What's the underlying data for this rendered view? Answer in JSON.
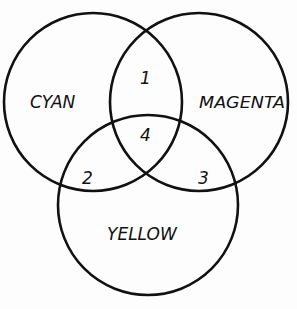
{
  "diagram": {
    "type": "venn",
    "stroke_color": "#111111",
    "background": "#fdfdfd",
    "sets": [
      {
        "name": "CYAN",
        "cx": 93,
        "cy": 102,
        "r": 89
      },
      {
        "name": "MAGENTA",
        "cx": 199,
        "cy": 102,
        "r": 89
      },
      {
        "name": "YELLOW",
        "cx": 148,
        "cy": 205,
        "r": 90
      }
    ],
    "regions": [
      {
        "label": "1",
        "between": [
          "CYAN",
          "MAGENTA"
        ]
      },
      {
        "label": "2",
        "between": [
          "CYAN",
          "YELLOW"
        ]
      },
      {
        "label": "3",
        "between": [
          "MAGENTA",
          "YELLOW"
        ]
      },
      {
        "label": "4",
        "between": [
          "CYAN",
          "MAGENTA",
          "YELLOW"
        ]
      }
    ]
  },
  "labels": {
    "cyan": "CYAN",
    "magenta": "MAGENTA",
    "yellow": "YELLOW",
    "r1": "1",
    "r2": "2",
    "r3": "3",
    "r4": "4"
  }
}
